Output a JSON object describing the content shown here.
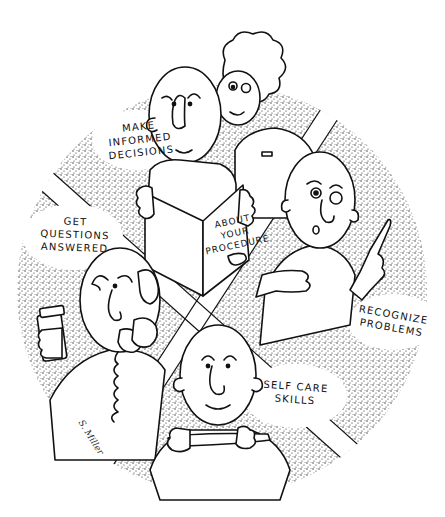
{
  "illustration": {
    "style": "pen-and-ink stipple cartoon",
    "colors": {
      "ink": "#111111",
      "background": "#ffffff",
      "stipple": "#222222"
    },
    "quadrants": [
      {
        "id": "top",
        "label": "MAKE\nINFORMED\nDECISIONS",
        "scene": "patient and nurse reading a booklet",
        "booklet_text": "ABOUT\nYOUR\nPROCEDURE"
      },
      {
        "id": "right",
        "label": "RECOGNIZE\nPROBLEMS",
        "scene": "surprised patient pointing"
      },
      {
        "id": "left",
        "label": "GET\nQUESTIONS\nANSWERED",
        "scene": "patient on telephone holding pill bottle"
      },
      {
        "id": "bottom",
        "label": "SELF CARE\nSKILLS",
        "scene": "smiling patient handling a device"
      }
    ],
    "signature": "S. Miller"
  }
}
